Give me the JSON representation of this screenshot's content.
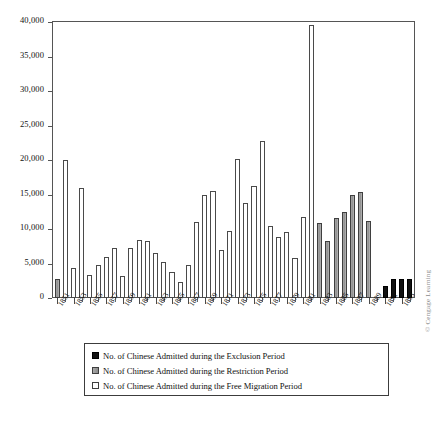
{
  "chart_data": {
    "type": "bar",
    "title": "",
    "xlabel": "",
    "ylabel": "",
    "ylim": [
      0,
      40000
    ],
    "ytick_labels": [
      "0",
      "5,000",
      "10,000",
      "15,000",
      "20,000",
      "25,000",
      "30,000",
      "35,000",
      "40,000"
    ],
    "ytick_values": [
      0,
      5000,
      10000,
      15000,
      20000,
      25000,
      30000,
      35000,
      40000
    ],
    "grid": false,
    "legend_position": "below-axes",
    "x_tick_label_step": 2,
    "x_tick_labels": [
      "1851",
      "1853",
      "1855",
      "1857",
      "1859",
      "1861",
      "1863",
      "1865",
      "1867",
      "1869",
      "1871",
      "1873",
      "1875",
      "1877",
      "1879",
      "1881",
      "1883",
      "1885",
      "1887",
      "1889",
      "1891",
      "1893"
    ],
    "categories": [
      "1851",
      "1852",
      "1853",
      "1854",
      "1855",
      "1856",
      "1857",
      "1858",
      "1859",
      "1860",
      "1861",
      "1862",
      "1863",
      "1864",
      "1865",
      "1866",
      "1867",
      "1868",
      "1869",
      "1870",
      "1871",
      "1872",
      "1873",
      "1874",
      "1875",
      "1876",
      "1877",
      "1878",
      "1879",
      "1880",
      "1881",
      "1882",
      "1883",
      "1884",
      "1885",
      "1886",
      "1887",
      "1888",
      "1889",
      "1890",
      "1891",
      "1892",
      "1893",
      "1894"
    ],
    "values": [
      2800,
      20000,
      4300,
      16000,
      3300,
      4800,
      5900,
      7300,
      3200,
      7300,
      8400,
      8200,
      6500,
      5200,
      3700,
      2300,
      4800,
      11000,
      14900,
      15500,
      7000,
      9700,
      20200,
      13700,
      16300,
      22700,
      10400,
      8800,
      9500,
      5800,
      11700,
      39500,
      10800,
      8300,
      11600,
      12500,
      14900,
      15400,
      11100,
      0,
      1700,
      2700,
      2700,
      2750
    ],
    "series": [
      {
        "name": "No. of Chinese Admitted during the Free Migration Period",
        "key": "free",
        "color": "#ffffff",
        "years": [
          "1851",
          "1852",
          "1853",
          "1854",
          "1855",
          "1856",
          "1857",
          "1858",
          "1859",
          "1860",
          "1861",
          "1862",
          "1863",
          "1864",
          "1865",
          "1866",
          "1867",
          "1868",
          "1869",
          "1870",
          "1871",
          "1872",
          "1873",
          "1874",
          "1875",
          "1876",
          "1877",
          "1878",
          "1879",
          "1880",
          "1881",
          "1882"
        ]
      },
      {
        "name": "No. of Chinese Admitted during the Restriction Period",
        "key": "restriction",
        "color": "#9a9a9a",
        "years": [
          "1883",
          "1884",
          "1885",
          "1886",
          "1887",
          "1888",
          "1889"
        ]
      },
      {
        "name": "No. of Chinese Admitted during the Exclusion Period",
        "key": "exclusion",
        "color": "#121212",
        "years": [
          "1891",
          "1892",
          "1893",
          "1894"
        ]
      }
    ],
    "bars": [
      {
        "year": "1851",
        "value": 2800,
        "series": "restriction"
      },
      {
        "year": "1852",
        "value": 20000,
        "series": "free"
      },
      {
        "year": "1853",
        "value": 4300,
        "series": "free"
      },
      {
        "year": "1854",
        "value": 16000,
        "series": "free"
      },
      {
        "year": "1855",
        "value": 3300,
        "series": "free"
      },
      {
        "year": "1856",
        "value": 4800,
        "series": "free"
      },
      {
        "year": "1857",
        "value": 5900,
        "series": "free"
      },
      {
        "year": "1858",
        "value": 7300,
        "series": "free"
      },
      {
        "year": "1859",
        "value": 3200,
        "series": "free"
      },
      {
        "year": "1860",
        "value": 7300,
        "series": "free"
      },
      {
        "year": "1861",
        "value": 8400,
        "series": "free"
      },
      {
        "year": "1862",
        "value": 8200,
        "series": "free"
      },
      {
        "year": "1863",
        "value": 6500,
        "series": "free"
      },
      {
        "year": "1864",
        "value": 5200,
        "series": "free"
      },
      {
        "year": "1865",
        "value": 3700,
        "series": "free"
      },
      {
        "year": "1866",
        "value": 2300,
        "series": "free"
      },
      {
        "year": "1867",
        "value": 4800,
        "series": "free"
      },
      {
        "year": "1868",
        "value": 11000,
        "series": "free"
      },
      {
        "year": "1869",
        "value": 14900,
        "series": "free"
      },
      {
        "year": "1870",
        "value": 15500,
        "series": "free"
      },
      {
        "year": "1871",
        "value": 7000,
        "series": "free"
      },
      {
        "year": "1872",
        "value": 9700,
        "series": "free"
      },
      {
        "year": "1873",
        "value": 20200,
        "series": "free"
      },
      {
        "year": "1874",
        "value": 13700,
        "series": "free"
      },
      {
        "year": "1875",
        "value": 16300,
        "series": "free"
      },
      {
        "year": "1876",
        "value": 22700,
        "series": "free"
      },
      {
        "year": "1877",
        "value": 10400,
        "series": "free"
      },
      {
        "year": "1878",
        "value": 8800,
        "series": "free"
      },
      {
        "year": "1879",
        "value": 9500,
        "series": "free"
      },
      {
        "year": "1880",
        "value": 5800,
        "series": "free"
      },
      {
        "year": "1881",
        "value": 11700,
        "series": "free"
      },
      {
        "year": "1882",
        "value": 39500,
        "series": "free"
      },
      {
        "year": "1883",
        "value": 10800,
        "series": "restriction"
      },
      {
        "year": "1884",
        "value": 8300,
        "series": "restriction"
      },
      {
        "year": "1885",
        "value": 11600,
        "series": "restriction"
      },
      {
        "year": "1886",
        "value": 12500,
        "series": "restriction"
      },
      {
        "year": "1887",
        "value": 14900,
        "series": "restriction"
      },
      {
        "year": "1888",
        "value": 15400,
        "series": "restriction"
      },
      {
        "year": "1889",
        "value": 11100,
        "series": "restriction"
      },
      {
        "year": "1890",
        "value": 0,
        "series": "exclusion"
      },
      {
        "year": "1891",
        "value": 1700,
        "series": "exclusion"
      },
      {
        "year": "1892",
        "value": 2700,
        "series": "exclusion"
      },
      {
        "year": "1893",
        "value": 2700,
        "series": "exclusion"
      },
      {
        "year": "1894",
        "value": 2750,
        "series": "exclusion"
      }
    ]
  },
  "legend": {
    "items": [
      {
        "label": "No. of Chinese Admitted during the Exclusion Period",
        "key": "exclusion"
      },
      {
        "label": "No. of Chinese Admitted during the Restriction Period",
        "key": "restriction"
      },
      {
        "label": "No. of Chinese Admitted during the Free Migration Period",
        "key": "free"
      }
    ]
  },
  "credit": "© Cengage Learning"
}
